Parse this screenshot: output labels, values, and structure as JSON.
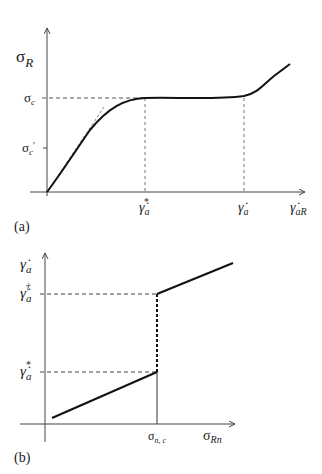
{
  "panel_a": {
    "label": "(a)",
    "y_axis_label": {
      "main": "σ",
      "sub": "R"
    },
    "x_axis_label": {
      "main": "γ̇",
      "sub": "aR"
    },
    "y_ticks": [
      {
        "main": "σ",
        "sub": "c",
        "prime": ""
      },
      {
        "main": "σ",
        "sub": "c",
        "prime": "′"
      }
    ],
    "x_ticks": [
      {
        "main": "γ̇",
        "sub": "a",
        "sup": "*"
      },
      {
        "main": "γ̇",
        "sub": "a",
        "sup": ""
      }
    ],
    "curve": "stress plateau curve: linear rise, plateau at σc, then rise",
    "tangent": "dashed initial-slope tangent"
  },
  "panel_b": {
    "label": "(b)",
    "y_axis_label": {
      "main": "γ̇",
      "sub": "a"
    },
    "x_axis_label": {
      "main": "σ",
      "sub": "Rn"
    },
    "y_ticks": [
      {
        "main": "γ̇",
        "sub": "a",
        "sup": "†"
      },
      {
        "main": "γ̇",
        "sub": "a",
        "sup": "*"
      }
    ],
    "x_ticks": [
      {
        "main": "σ",
        "sub": "n, c"
      }
    ],
    "curve": "lower solid branch, dashed jump at σn,c, upper solid branch"
  }
}
